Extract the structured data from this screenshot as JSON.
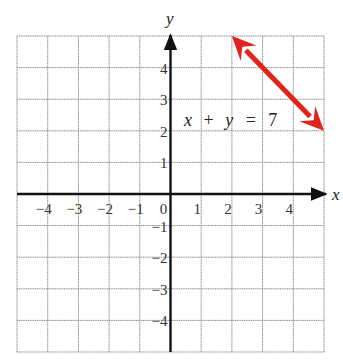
{
  "chart_data": {
    "type": "line",
    "title": "",
    "xlabel": "x",
    "ylabel": "y",
    "xlim": [
      -5,
      5
    ],
    "ylim": [
      -5,
      5
    ],
    "grid": true,
    "x_ticks": [
      -4,
      -3,
      -2,
      -1,
      0,
      1,
      2,
      3,
      4
    ],
    "y_ticks": [
      4,
      3,
      2,
      1,
      -1,
      -2,
      -3,
      -4
    ],
    "x_tick_labels": [
      "−4",
      "−3",
      "−2",
      "−1",
      "0",
      "1",
      "2",
      "3",
      "4"
    ],
    "y_tick_labels": [
      "4",
      "3",
      "2",
      "1",
      "−1",
      "−2",
      "−3",
      "−4"
    ],
    "series": [
      {
        "name": "x + y = 7",
        "color": "#e0231b",
        "x": [
          2,
          5
        ],
        "y": [
          5,
          2
        ],
        "arrows": "both"
      }
    ],
    "annotations": [
      {
        "text": "x + y = 7",
        "x": 0.5,
        "y": 2.5
      }
    ],
    "legend": "none"
  },
  "labels": {
    "x_axis": "x",
    "y_axis": "y",
    "equation": {
      "x": "x",
      "plus": "+",
      "y": "y",
      "eq": "=",
      "rhs": "7"
    }
  },
  "colors": {
    "grid": "#8a8a8a",
    "axis": "#111111",
    "line": "#e0231b"
  }
}
